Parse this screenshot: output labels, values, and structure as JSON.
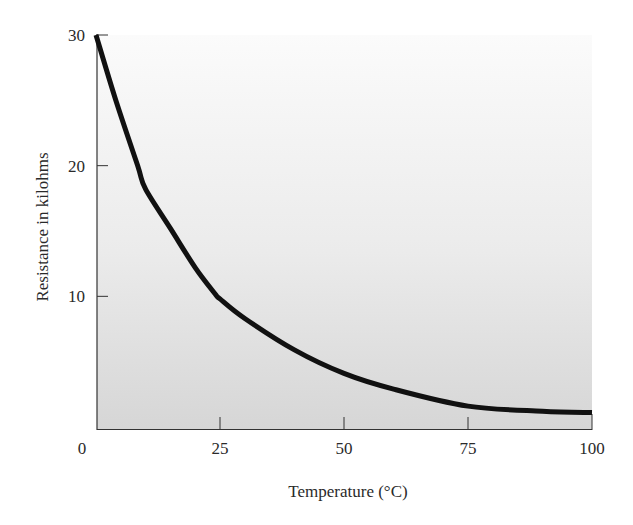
{
  "chart_data": {
    "type": "line",
    "title": "",
    "xlabel": "Temperature (°C)",
    "ylabel": "Resistance in kilohms",
    "xlim": [
      0,
      100
    ],
    "ylim": [
      0,
      30
    ],
    "x_ticks": [
      0,
      25,
      50,
      75,
      100
    ],
    "x_tick_labels": [
      "0",
      "25",
      "50",
      "75",
      "100"
    ],
    "y_ticks": [
      10,
      20,
      30
    ],
    "y_tick_labels": [
      "10",
      "20",
      "30"
    ],
    "grid": false,
    "legend": null,
    "series": [
      {
        "name": "Thermistor resistance",
        "color": "#111111",
        "x": [
          0,
          4,
          8.4,
          10,
          15,
          20,
          24,
          25,
          30,
          40,
          50,
          60,
          75,
          90,
          100
        ],
        "y": [
          30,
          25,
          20,
          18.2,
          15.2,
          12.2,
          10.2,
          9.8,
          8.3,
          5.9,
          4.1,
          2.9,
          1.6,
          1.2,
          1.1
        ]
      }
    ],
    "plot_background": {
      "top_color": "#fbfbfb",
      "bottom_color": "#d6d6d6"
    }
  }
}
